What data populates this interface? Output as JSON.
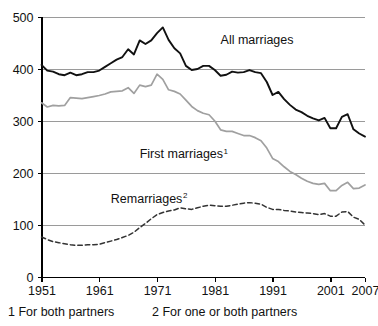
{
  "figure": {
    "width": 378,
    "height": 326,
    "background": "#ffffff"
  },
  "footnotes": {
    "note1": "1 For both partners",
    "note2": "2 For one or both partners"
  },
  "chart_data": {
    "type": "line",
    "title": "",
    "subtitle": "",
    "xlabel": "",
    "ylabel": "",
    "xlim": [
      1951,
      2007
    ],
    "ylim": [
      0,
      500
    ],
    "grid": true,
    "grid_axis": "y",
    "legend": "inline-annotations",
    "x_ticks": [
      1951,
      1961,
      1971,
      1981,
      1991,
      2001,
      2007
    ],
    "x_tick_labels": [
      "1951",
      "1961",
      "1971",
      "1981",
      "1991",
      "2001",
      "2007"
    ],
    "y_ticks": [
      0,
      100,
      200,
      300,
      400,
      500
    ],
    "y_tick_labels": [
      "0",
      "100",
      "200",
      "300",
      "400",
      "500"
    ],
    "x": [
      1951,
      1952,
      1953,
      1954,
      1955,
      1956,
      1957,
      1958,
      1959,
      1960,
      1961,
      1962,
      1963,
      1964,
      1965,
      1966,
      1967,
      1968,
      1969,
      1970,
      1971,
      1972,
      1973,
      1974,
      1975,
      1976,
      1977,
      1978,
      1979,
      1980,
      1981,
      1982,
      1983,
      1984,
      1985,
      1986,
      1987,
      1988,
      1989,
      1990,
      1991,
      1992,
      1993,
      1994,
      1995,
      1996,
      1997,
      1998,
      1999,
      2000,
      2001,
      2002,
      2003,
      2004,
      2005,
      2006,
      2007
    ],
    "series": [
      {
        "name": "All marriages",
        "style": "solid",
        "color": "#111111",
        "width": 1.9,
        "label_x": 1982,
        "label_y": 448,
        "superscript": "",
        "values": [
          408,
          397,
          395,
          390,
          388,
          393,
          388,
          390,
          394,
          394,
          397,
          404,
          411,
          418,
          423,
          438,
          428,
          455,
          448,
          455,
          469,
          480,
          456,
          440,
          430,
          406,
          398,
          400,
          406,
          406,
          398,
          387,
          389,
          395,
          393,
          394,
          398,
          394,
          392,
          375,
          350,
          356,
          342,
          331,
          322,
          317,
          310,
          305,
          301,
          306,
          286,
          286,
          308,
          313,
          284,
          276,
          270
        ]
      },
      {
        "name": "First marriages",
        "style": "solid",
        "color": "#a0a0a0",
        "width": 1.7,
        "label_x": 1968,
        "label_y": 228,
        "superscript": "1",
        "values": [
          335,
          327,
          330,
          329,
          330,
          345,
          344,
          343,
          345,
          347,
          349,
          352,
          356,
          357,
          358,
          364,
          353,
          369,
          366,
          369,
          390,
          380,
          360,
          357,
          352,
          340,
          328,
          320,
          315,
          312,
          300,
          283,
          280,
          280,
          276,
          272,
          272,
          268,
          262,
          248,
          228,
          222,
          212,
          203,
          197,
          190,
          184,
          180,
          178,
          180,
          166,
          166,
          176,
          182,
          170,
          171,
          177
        ]
      },
      {
        "name": "Remarriages",
        "style": "dashed",
        "color": "#333333",
        "width": 1.5,
        "label_x": 1963,
        "label_y": 143,
        "superscript": "2",
        "values": [
          77,
          72,
          68,
          66,
          64,
          62,
          61,
          61,
          62,
          62,
          63,
          66,
          69,
          72,
          76,
          80,
          86,
          95,
          103,
          112,
          120,
          124,
          127,
          129,
          133,
          131,
          130,
          133,
          136,
          138,
          137,
          136,
          136,
          138,
          140,
          142,
          143,
          142,
          140,
          134,
          130,
          130,
          128,
          127,
          125,
          124,
          123,
          122,
          120,
          122,
          117,
          117,
          125,
          126,
          115,
          111,
          100
        ]
      }
    ]
  }
}
